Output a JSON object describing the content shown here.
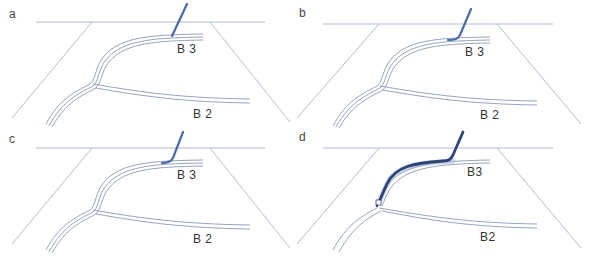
{
  "figure": {
    "panels": [
      {
        "id": "a",
        "label": "a",
        "b3": "B 3",
        "b2": "B 2",
        "scope": "short-tip"
      },
      {
        "id": "b",
        "label": "b",
        "b3": "B 3",
        "b2": "B 2",
        "scope": "bent-tip"
      },
      {
        "id": "c",
        "label": "c",
        "b3": "B 3",
        "b2": "B 2",
        "scope": "bent-tip"
      },
      {
        "id": "d",
        "label": "d",
        "b3": "B3",
        "b2": "B2",
        "scope": "inserted"
      }
    ],
    "colors": {
      "airway": "#8a98b8",
      "frame": "#b0bcd4",
      "scope_light": "#4a6aa8",
      "scope_dark": "#2e4476"
    }
  }
}
